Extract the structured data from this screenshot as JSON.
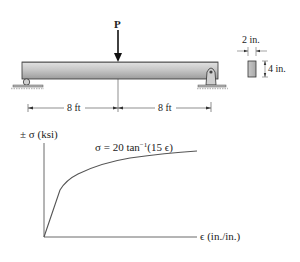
{
  "beam": {
    "load_label": "P",
    "span_left": "8 ft",
    "span_right": "8 ft",
    "supports": [
      "roller",
      "pin"
    ]
  },
  "cross_section": {
    "width_label": "2 in.",
    "height_label": "4 in."
  },
  "graph": {
    "y_label": "± σ (ksi)",
    "x_label": "ϵ (in./in.)",
    "equation_prefix": "σ = 20 tan",
    "equation_sup": "−1",
    "equation_suffix": "(15 ϵ)"
  },
  "colors": {
    "beam_fill_top": "#d8d8d8",
    "beam_fill_bottom": "#a8a8a8",
    "line": "#222222",
    "curve": "#555555",
    "ground": "#9a9a9a"
  }
}
